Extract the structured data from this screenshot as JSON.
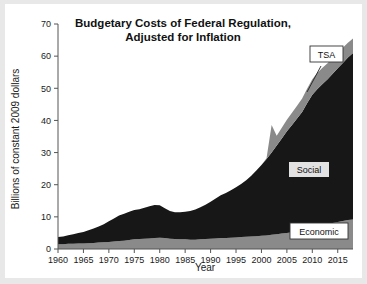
{
  "figure": {
    "background": "#ffffff",
    "page_background": "#e8e8e8"
  },
  "chart_data": {
    "type": "area",
    "stacked": true,
    "title": "Budgetary Costs of Federal Regulation, Adjusted for Inflation",
    "title_line1": "Budgetary Costs of Federal Regulation,",
    "title_line2": "Adjusted for Inflation",
    "xlabel": "Year",
    "ylabel": "Billions of constant 2009 dollars",
    "xlim": [
      1960,
      2018
    ],
    "ylim": [
      0,
      70
    ],
    "ytick_step": 10,
    "xtick_step": 5,
    "grid": false,
    "legend_position": "inline-annotations",
    "xticks": [
      1960,
      1965,
      1970,
      1975,
      1980,
      1985,
      1990,
      1995,
      2000,
      2005,
      2010,
      2015
    ],
    "yticks": [
      0,
      10,
      20,
      30,
      40,
      50,
      60,
      70
    ],
    "x": [
      1960,
      1961,
      1962,
      1963,
      1964,
      1965,
      1966,
      1967,
      1968,
      1969,
      1970,
      1971,
      1972,
      1973,
      1974,
      1975,
      1976,
      1977,
      1978,
      1979,
      1980,
      1981,
      1982,
      1983,
      1984,
      1985,
      1986,
      1987,
      1988,
      1989,
      1990,
      1991,
      1992,
      1993,
      1994,
      1995,
      1996,
      1997,
      1998,
      1999,
      2000,
      2001,
      2002,
      2003,
      2004,
      2005,
      2006,
      2007,
      2008,
      2009,
      2010,
      2011,
      2012,
      2013,
      2014,
      2015,
      2016,
      2017,
      2018
    ],
    "series": [
      {
        "name": "Economic",
        "color": "#8a8a8a",
        "values": [
          1.5,
          1.5,
          1.6,
          1.6,
          1.7,
          1.7,
          1.8,
          1.9,
          2.0,
          2.1,
          2.2,
          2.3,
          2.5,
          2.6,
          2.8,
          3.0,
          3.1,
          3.2,
          3.3,
          3.4,
          3.5,
          3.4,
          3.2,
          3.1,
          3.0,
          3.0,
          2.9,
          2.9,
          3.0,
          3.1,
          3.2,
          3.3,
          3.4,
          3.4,
          3.5,
          3.6,
          3.7,
          3.8,
          3.9,
          4.0,
          4.1,
          4.2,
          4.4,
          4.6,
          4.8,
          5.0,
          5.2,
          5.4,
          5.6,
          6.2,
          6.8,
          7.2,
          7.5,
          7.8,
          8.1,
          8.4,
          8.7,
          9.0,
          9.2
        ]
      },
      {
        "name": "Social",
        "color": "#171717",
        "values": [
          2.2,
          2.4,
          2.7,
          3.0,
          3.3,
          3.6,
          4.0,
          4.5,
          5.0,
          5.6,
          6.4,
          7.2,
          7.9,
          8.4,
          8.8,
          9.1,
          9.3,
          9.6,
          10.0,
          10.3,
          10.1,
          9.3,
          8.6,
          8.3,
          8.4,
          8.6,
          8.9,
          9.4,
          10.0,
          10.7,
          11.5,
          12.4,
          13.3,
          14.0,
          14.8,
          15.6,
          16.5,
          17.6,
          18.9,
          20.4,
          22.0,
          23.8,
          25.6,
          27.6,
          29.6,
          31.6,
          33.4,
          35.2,
          37.0,
          39.2,
          41.2,
          42.6,
          43.8,
          45.0,
          46.4,
          47.8,
          49.2,
          50.6,
          51.8
        ]
      },
      {
        "name": "TSA",
        "color": "#8a8a8a",
        "values": [
          0,
          0,
          0,
          0,
          0,
          0,
          0,
          0,
          0,
          0,
          0,
          0,
          0,
          0,
          0,
          0,
          0,
          0,
          0,
          0,
          0,
          0,
          0,
          0,
          0,
          0,
          0,
          0,
          0,
          0,
          0,
          0,
          0,
          0,
          0,
          0,
          0,
          0,
          0,
          0,
          0,
          0.2,
          8.6,
          3.0,
          3.3,
          3.6,
          3.8,
          4.0,
          4.2,
          4.5,
          4.8,
          5.0,
          5.1,
          5.0,
          4.9,
          4.8,
          4.7,
          4.6,
          4.5
        ]
      }
    ],
    "annotations": [
      {
        "label": "TSA",
        "boxed": true,
        "has_leader": true
      },
      {
        "label": "Social",
        "boxed": true,
        "has_leader": false
      },
      {
        "label": "Economic",
        "boxed": true,
        "has_leader": false
      }
    ]
  }
}
